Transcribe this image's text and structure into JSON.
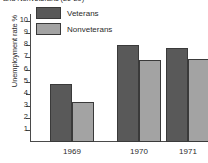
{
  "chart_data": {
    "type": "bar",
    "title": "and Nonveterans (20-29)",
    "xlabel": "",
    "ylabel": "Unemployment rate %",
    "categories": [
      "1969",
      "1970",
      "1971"
    ],
    "series": [
      {
        "name": "Veterans",
        "color": "#595959",
        "values": [
          4.8,
          8.0,
          7.8
        ]
      },
      {
        "name": "Nonveterans",
        "color": "#a3a3a3",
        "values": [
          3.3,
          6.8,
          6.9
        ]
      }
    ],
    "ylim": [
      0,
      10.6
    ],
    "yticks": [
      "10",
      "9",
      "8",
      "7",
      "6",
      "5",
      "4",
      "3",
      "2",
      "1"
    ],
    "ytick_values": [
      10,
      9,
      8,
      7,
      6,
      5,
      4,
      3,
      2,
      1
    ],
    "grid": false,
    "legend_position": "top-left"
  }
}
